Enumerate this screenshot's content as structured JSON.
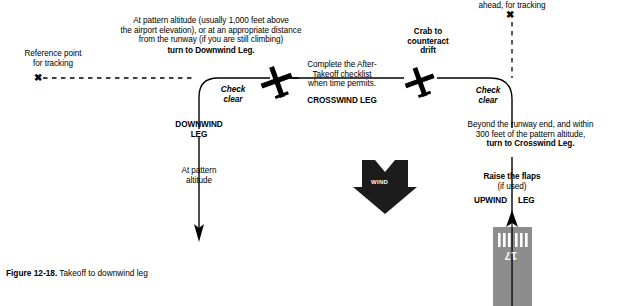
{
  "figure": {
    "number": "Figure 12-18.",
    "caption": "Takeoff to downwind leg"
  },
  "labels": {
    "reference_point_left": "Reference point\nfor tracking",
    "top_note_plain": "At pattern altitude (usually 1,000 feet above\nthe airport elevation), or at an appropriate distance\nfrom the runway (if you are still climbing)",
    "top_note_bold": "turn to Downwind Leg.",
    "ahead_for_tracking": "ahead, for tracking",
    "check_clear_left": "Check\nclear",
    "check_clear_right": "Check\nclear",
    "downwind_leg": "DOWNWIND\nLEG",
    "crosswind_note_plain": "Complete the After-\nTakeoff checklist\nwhen time permits.",
    "crosswind_leg": "CROSSWIND LEG",
    "crab_note": "Crab to\ncounteract\ndrift",
    "beyond_note_plain": "Beyond the runway end, and within\n300 feet of the pattern altitude,",
    "beyond_note_bold": "turn to Crosswind Leg.",
    "at_pattern_altitude": "At pattern\naltitude",
    "raise_flaps_bold": "Raise the flaps",
    "raise_flaps_plain": "(if used)",
    "upwind_left": "UPWIND",
    "upwind_right": "LEG",
    "wind": "WIND",
    "runway_number": "17",
    "x_glyph": "✖"
  },
  "colors": {
    "ink": "#000000",
    "runway_fill": "#8d8d8d",
    "wind_fill": "#1c1c1c",
    "paper": "#ffffff"
  },
  "diagram": {
    "type": "traffic-pattern-schematic",
    "legs": [
      "UPWIND LEG",
      "CROSSWIND LEG",
      "DOWNWIND LEG"
    ],
    "aircraft_symbols": 2,
    "wind_direction": "from top, blowing down",
    "runway_designator": "17"
  }
}
